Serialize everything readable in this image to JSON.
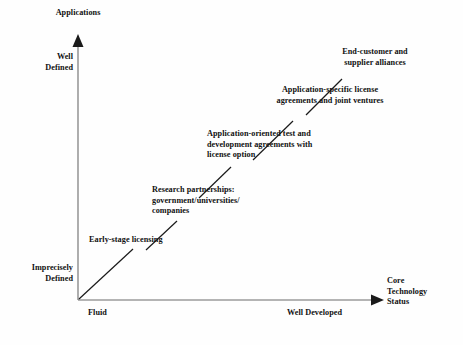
{
  "figure": {
    "background_color": "#fefefe",
    "ink_color": "#111111"
  },
  "axes": {
    "y": {
      "title": "Applications",
      "high_label": "Well\nDefined",
      "low_label": "Imprecisely\nDefined"
    },
    "x": {
      "title": "Core\nTechnology\nStatus",
      "low_label": "Fluid",
      "high_label": "Well Developed"
    }
  },
  "stages": [
    {
      "id": "early-stage-licensing",
      "label": "Early-stage licensing",
      "align": "left"
    },
    {
      "id": "research-partnerships",
      "label": "Research partnerships:\ngovernment/universities/\ncompanies",
      "align": "left"
    },
    {
      "id": "application-oriented-test",
      "label": "Application-oriented test and\ndevelopment agreements with\nlicense option",
      "align": "left"
    },
    {
      "id": "application-specific-license",
      "label": "Application-specific license\nagreements and joint ventures",
      "align": "center"
    },
    {
      "id": "end-customer-alliances",
      "label": "End-customer and\nsupplier alliances",
      "align": "center"
    }
  ]
}
